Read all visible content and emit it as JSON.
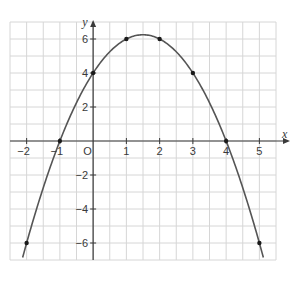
{
  "chart_data": {
    "type": "line",
    "title": "",
    "function": "y = -x^2 + 3x + 4",
    "xlabel": "x",
    "ylabel": "y",
    "origin_label": "O",
    "xlim": [
      -2.5,
      5.5
    ],
    "ylim": [
      -7,
      7
    ],
    "grid": true,
    "grid_step": 0.5,
    "x_ticks": [
      -2,
      -1,
      1,
      2,
      3,
      4,
      5
    ],
    "y_ticks": [
      -6,
      -4,
      -2,
      2,
      4,
      6
    ],
    "x_tick_labels": [
      "−2",
      "−1",
      "1",
      "2",
      "3",
      "4",
      "5"
    ],
    "y_tick_labels": [
      "−6",
      "−4",
      "−2",
      "2",
      "4",
      "6"
    ],
    "points": [
      {
        "x": -2,
        "y": -6
      },
      {
        "x": -1,
        "y": 0
      },
      {
        "x": 0,
        "y": 4
      },
      {
        "x": 1,
        "y": 6
      },
      {
        "x": 2,
        "y": 6
      },
      {
        "x": 3,
        "y": 4
      },
      {
        "x": 4,
        "y": 0
      },
      {
        "x": 5,
        "y": -6
      }
    ],
    "curve_x_range": [
      -2.12,
      5.12
    ],
    "legend": null
  },
  "colors": {
    "grid": "#d6d6d6",
    "axis": "#3a3a3a",
    "curve": "#555555",
    "point": "#1a1a1a"
  }
}
